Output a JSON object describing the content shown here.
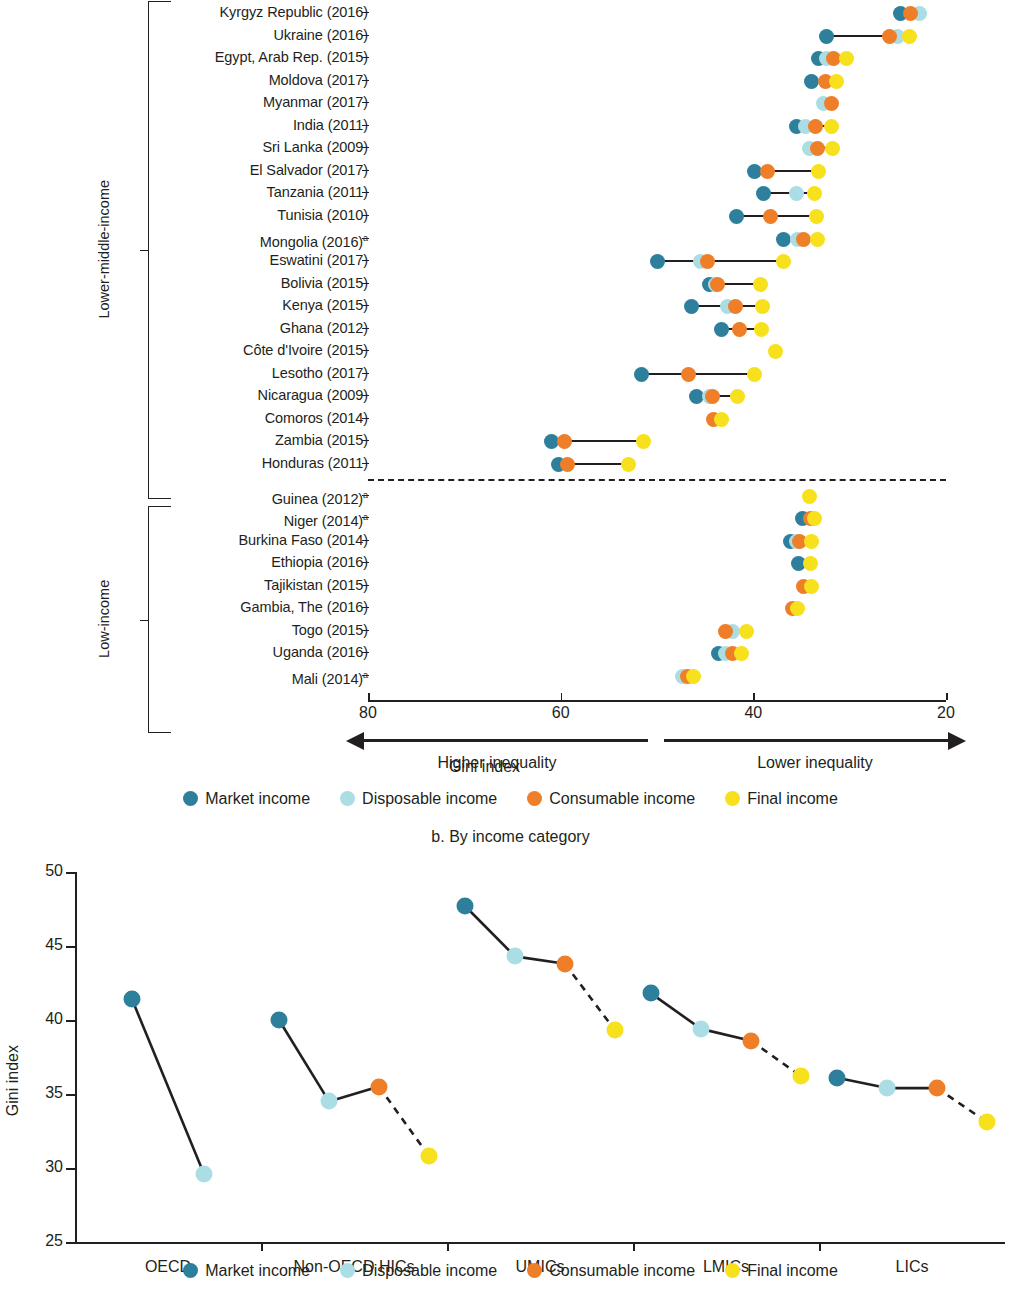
{
  "colors": {
    "market": "#2d7f9b",
    "disposable": "#aadee4",
    "consumable": "#ef7e29",
    "final": "#f7e01c",
    "ink": "#231f20"
  },
  "legend": {
    "market": "Market income",
    "disposable": "Disposable income",
    "consumable": "Consumable income",
    "final": "Final income"
  },
  "panel_a": {
    "axis_title": "Gini index",
    "arrow_left": "Higher inequality",
    "arrow_right": "Lower inequality",
    "ticks": [
      "80",
      "60",
      "40",
      "20"
    ],
    "groups": [
      {
        "label": "Lower-middle-income",
        "count": 22
      },
      {
        "label": "Low-income",
        "count": 10
      }
    ]
  },
  "panel_b": {
    "subtitle": "b. By income category",
    "ylabel": "Gini index"
  },
  "chart_data": [
    {
      "type": "scatter",
      "panel": "a",
      "title": "",
      "xlabel": "Gini index",
      "ylabel": "",
      "xlim": [
        80,
        20
      ],
      "xticks": [
        80,
        60,
        40,
        20
      ],
      "grid": false,
      "legend_position": "bottom",
      "series_names": [
        "Market income",
        "Disposable income",
        "Consumable income",
        "Final income"
      ],
      "annotations": [
        "Higher inequality",
        "Lower inequality",
        "a. Dashed line separates lower-middle-income from low-income economies"
      ],
      "groups": [
        "Lower-middle-income",
        "Low-income"
      ],
      "categories": [
        "Kyrgyz Republic (2016)",
        "Ukraine (2016)",
        "Egypt, Arab Rep. (2015)",
        "Moldova (2017)",
        "Myanmar (2017)",
        "India (2011)",
        "Sri Lanka (2009)",
        "El Salvador (2017)",
        "Tanzania (2011)",
        "Tunisia (2010)",
        "Mongolia (2016)a",
        "Eswatini (2017)",
        "Bolivia (2015)",
        "Kenya (2015)",
        "Ghana (2012)",
        "Côte d'Ivoire (2015)",
        "Lesotho (2017)",
        "Nicaragua (2009)",
        "Comoros (2014)",
        "Zambia (2015)",
        "Honduras (2011)",
        "Guinea (2012)a",
        "Niger (2014)a",
        "Burkina Faso (2014)",
        "Ethiopia (2016)",
        "Tajikistan (2015)",
        "Gambia, The (2016)",
        "Togo (2015)",
        "Uganda (2016)",
        "Mali (2014)a"
      ],
      "rows": [
        {
          "name": "Kyrgyz Republic (2016)",
          "group": "Lower-middle-income",
          "market": 24.7,
          "disposable": 22.8,
          "consumable": 23.7,
          "final": null
        },
        {
          "name": "Ukraine (2016)",
          "group": "Lower-middle-income",
          "market": 32.4,
          "disposable": 25.0,
          "consumable": 25.9,
          "final": 23.8
        },
        {
          "name": "Egypt, Arab Rep. (2015)",
          "group": "Lower-middle-income",
          "market": 33.2,
          "disposable": 32.4,
          "consumable": 31.7,
          "final": 30.3
        },
        {
          "name": "Moldova (2017)",
          "group": "Lower-middle-income",
          "market": 34.0,
          "disposable": null,
          "consumable": 32.5,
          "final": 31.4
        },
        {
          "name": "Myanmar (2017)",
          "group": "Lower-middle-income",
          "market": null,
          "disposable": 32.7,
          "consumable": 31.9,
          "final": null
        },
        {
          "name": "India (2011)",
          "group": "Lower-middle-income",
          "market": 35.5,
          "disposable": 34.6,
          "consumable": 33.5,
          "final": 31.9
        },
        {
          "name": "Sri Lanka (2009)",
          "group": "Lower-middle-income",
          "market": null,
          "disposable": 34.2,
          "consumable": 33.3,
          "final": 31.8
        },
        {
          "name": "El Salvador (2017)",
          "group": "Lower-middle-income",
          "market": 39.9,
          "disposable": null,
          "consumable": 38.5,
          "final": 33.2
        },
        {
          "name": "Tanzania (2011)",
          "group": "Lower-middle-income",
          "market": 38.9,
          "disposable": 35.5,
          "consumable": null,
          "final": 33.6
        },
        {
          "name": "Tunisia (2010)",
          "group": "Lower-middle-income",
          "market": 41.7,
          "disposable": null,
          "consumable": 38.2,
          "final": 33.4
        },
        {
          "name": "Mongolia (2016)a",
          "group": "Lower-middle-income",
          "market": 36.9,
          "disposable": 35.4,
          "consumable": 34.8,
          "final": 33.3
        },
        {
          "name": "Eswatini (2017)",
          "group": "Lower-middle-income",
          "market": 49.9,
          "disposable": 45.5,
          "consumable": 44.8,
          "final": 36.9
        },
        {
          "name": "Bolivia (2015)",
          "group": "Lower-middle-income",
          "market": 44.5,
          "disposable": 43.9,
          "consumable": 43.7,
          "final": 39.3
        },
        {
          "name": "Kenya (2015)",
          "group": "Lower-middle-income",
          "market": 46.4,
          "disposable": 42.7,
          "consumable": 41.9,
          "final": 39.1
        },
        {
          "name": "Ghana (2012)",
          "group": "Lower-middle-income",
          "market": 43.3,
          "disposable": null,
          "consumable": 41.4,
          "final": 39.2
        },
        {
          "name": "Côte d'Ivoire (2015)",
          "group": "Lower-middle-income",
          "market": null,
          "disposable": null,
          "consumable": null,
          "final": 37.7
        },
        {
          "name": "Lesotho (2017)",
          "group": "Lower-middle-income",
          "market": 51.6,
          "disposable": null,
          "consumable": 46.7,
          "final": 39.9
        },
        {
          "name": "Nicaragua (2009)",
          "group": "Lower-middle-income",
          "market": 45.9,
          "disposable": 44.6,
          "consumable": 44.2,
          "final": 41.6
        },
        {
          "name": "Comoros (2014)",
          "group": "Lower-middle-income",
          "market": null,
          "disposable": null,
          "consumable": 44.1,
          "final": 43.3
        },
        {
          "name": "Zambia (2015)",
          "group": "Lower-middle-income",
          "market": 60.9,
          "disposable": null,
          "consumable": 59.6,
          "final": 51.4
        },
        {
          "name": "Honduras (2011)",
          "group": "Lower-middle-income",
          "market": 60.2,
          "disposable": null,
          "consumable": 59.3,
          "final": 53.0
        },
        {
          "name": "Guinea (2012)a",
          "group": "Low-income",
          "market": null,
          "disposable": null,
          "consumable": null,
          "final": 34.2
        },
        {
          "name": "Niger (2014)a",
          "group": "Low-income",
          "market": 34.9,
          "disposable": null,
          "consumable": 34.1,
          "final": 33.6
        },
        {
          "name": "Burkina Faso (2014)",
          "group": "Low-income",
          "market": 36.1,
          "disposable": 35.5,
          "consumable": 35.2,
          "final": 34.0
        },
        {
          "name": "Ethiopia (2016)",
          "group": "Low-income",
          "market": 35.3,
          "disposable": null,
          "consumable": null,
          "final": 34.1
        },
        {
          "name": "Tajikistan (2015)",
          "group": "Low-income",
          "market": null,
          "disposable": null,
          "consumable": 34.8,
          "final": 34.0
        },
        {
          "name": "Gambia, The (2016)",
          "group": "Low-income",
          "market": null,
          "disposable": null,
          "consumable": 35.9,
          "final": 35.4
        },
        {
          "name": "Togo (2015)",
          "group": "Low-income",
          "market": null,
          "disposable": 42.2,
          "consumable": 42.9,
          "final": 40.7
        },
        {
          "name": "Uganda (2016)",
          "group": "Low-income",
          "market": 43.6,
          "disposable": 42.9,
          "consumable": 42.2,
          "final": 41.2
        },
        {
          "name": "Mali (2014)a",
          "group": "Low-income",
          "market": null,
          "disposable": 47.4,
          "consumable": 46.8,
          "final": 46.2
        }
      ]
    },
    {
      "type": "line",
      "panel": "b",
      "title": "b. By income category",
      "xlabel": "",
      "ylabel": "Gini index",
      "ylim": [
        25,
        50
      ],
      "yticks": [
        25,
        30,
        35,
        40,
        45,
        50
      ],
      "grid": false,
      "legend_position": "bottom",
      "categories": [
        "OECD",
        "Non-OECD HICs",
        "UMICs",
        "LMICs",
        "LICs"
      ],
      "series": [
        {
          "name": "Market income",
          "values": [
            41.4,
            40.0,
            47.7,
            41.8,
            36.1
          ]
        },
        {
          "name": "Disposable income",
          "values": [
            29.6,
            34.5,
            44.3,
            39.4,
            35.4
          ]
        },
        {
          "name": "Consumable income",
          "values": [
            null,
            35.5,
            43.8,
            38.6,
            35.4
          ]
        },
        {
          "name": "Final income",
          "values": [
            null,
            30.8,
            39.3,
            36.2,
            33.1
          ]
        }
      ]
    }
  ]
}
